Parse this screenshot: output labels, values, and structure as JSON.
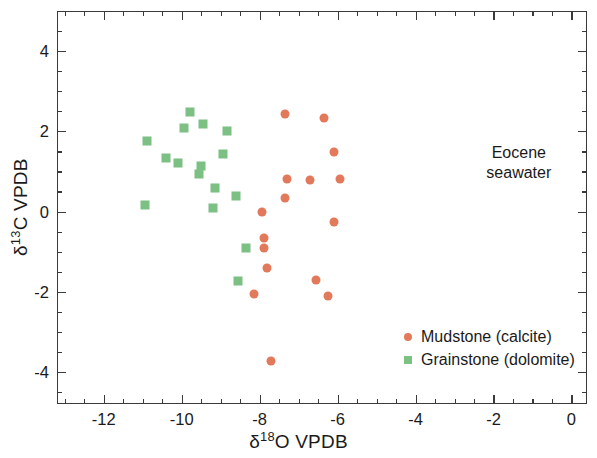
{
  "chart_data": {
    "type": "scatter",
    "title": "",
    "xlabel": "δ18O VPDB",
    "ylabel": "δ13C VPDB",
    "xlim": [
      -13.2,
      0.4
    ],
    "ylim": [
      -4.8,
      5.0
    ],
    "xticks": [
      -12,
      -10,
      -8,
      -6,
      -4,
      -2,
      0
    ],
    "xticklabels": [
      "-12",
      "-10",
      "-8",
      "-6",
      "-4",
      "-2",
      "0"
    ],
    "yticks": [
      -4,
      -2,
      0,
      2,
      4
    ],
    "yticklabels": [
      "-4",
      "-2",
      "0",
      "2",
      "4"
    ],
    "minor_tick_interval_x": 0.5,
    "minor_tick_interval_y": 0.5,
    "grid": false,
    "legend_position": "lower right (inside axes)",
    "annotations": [
      {
        "text": "Eocene\nseawater",
        "x": -1.35,
        "y": 1.25
      }
    ],
    "series": [
      {
        "name": "Mudstone (calcite)",
        "marker": "circle",
        "color": "#e2795a",
        "points": [
          {
            "x": -7.35,
            "y": 2.42
          },
          {
            "x": -6.35,
            "y": 2.32
          },
          {
            "x": -6.1,
            "y": 1.48
          },
          {
            "x": -7.3,
            "y": 0.82
          },
          {
            "x": -6.7,
            "y": 0.78
          },
          {
            "x": -5.95,
            "y": 0.82
          },
          {
            "x": -7.35,
            "y": 0.34
          },
          {
            "x": -6.1,
            "y": -0.26
          },
          {
            "x": -7.95,
            "y": -0.02
          },
          {
            "x": -7.9,
            "y": -0.66
          },
          {
            "x": -7.9,
            "y": -0.92
          },
          {
            "x": -7.8,
            "y": -1.42
          },
          {
            "x": -6.55,
            "y": -1.7
          },
          {
            "x": -6.25,
            "y": -2.1
          },
          {
            "x": -8.15,
            "y": -2.06
          },
          {
            "x": -7.7,
            "y": -3.72
          }
        ]
      },
      {
        "name": "Grainstone (dolomite)",
        "marker": "square",
        "color": "#7cc083",
        "points": [
          {
            "x": -9.8,
            "y": 2.48
          },
          {
            "x": -9.45,
            "y": 2.18
          },
          {
            "x": -9.95,
            "y": 2.08
          },
          {
            "x": -8.85,
            "y": 2.02
          },
          {
            "x": -10.9,
            "y": 1.76
          },
          {
            "x": -10.4,
            "y": 1.34
          },
          {
            "x": -8.95,
            "y": 1.44
          },
          {
            "x": -10.1,
            "y": 1.22
          },
          {
            "x": -9.5,
            "y": 1.14
          },
          {
            "x": -9.55,
            "y": 0.94
          },
          {
            "x": -9.15,
            "y": 0.58
          },
          {
            "x": -8.6,
            "y": 0.38
          },
          {
            "x": -9.2,
            "y": 0.1
          },
          {
            "x": -10.95,
            "y": 0.16
          },
          {
            "x": -8.35,
            "y": -0.9
          },
          {
            "x": -8.55,
            "y": -1.74
          }
        ]
      }
    ]
  },
  "axis_titles": {
    "x_prefix": "δ",
    "x_sup": "18",
    "x_suffix": "O VPDB",
    "y_prefix": "δ",
    "y_sup": "13",
    "y_suffix": "C VPDB"
  },
  "annotation": {
    "line1": "Eocene",
    "line2": "seawater"
  },
  "legend": {
    "items": [
      {
        "label": "Mudstone (calcite)",
        "marker": "circle"
      },
      {
        "label": "Grainstone (dolomite)",
        "marker": "square"
      }
    ]
  },
  "colors": {
    "mudstone": "#e2795a",
    "grainstone": "#7cc083",
    "axis": "#3a3a3a",
    "text": "#1a1a1a",
    "background": "#ffffff"
  }
}
